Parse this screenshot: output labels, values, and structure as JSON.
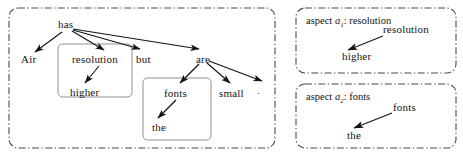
{
  "figure": {
    "type": "dependency-parse-diagram",
    "background_color": "#ffffff",
    "ink_color": "#141414",
    "panel_border_color": "#4a4a4a",
    "box_border_color": "#8a8a8a"
  },
  "left_panel": {
    "name": "full-sentence-dependency-tree",
    "nodes": [
      {
        "id": "has",
        "label": "has",
        "x": 58,
        "y": 21
      },
      {
        "id": "air",
        "label": "Air",
        "x": 21,
        "y": 55
      },
      {
        "id": "resolution",
        "label": "resolution",
        "x": 72,
        "y": 55
      },
      {
        "id": "but",
        "label": "but",
        "x": 136,
        "y": 55
      },
      {
        "id": "higher",
        "label": "higher",
        "x": 70,
        "y": 88
      },
      {
        "id": "are",
        "label": "are",
        "x": 196,
        "y": 55
      },
      {
        "id": "fonts",
        "label": "fonts",
        "x": 164,
        "y": 89
      },
      {
        "id": "small",
        "label": "small",
        "x": 219,
        "y": 89
      },
      {
        "id": "the",
        "label": "the",
        "x": 152,
        "y": 123
      },
      {
        "id": "period",
        "label": ".",
        "x": 258,
        "y": 86
      }
    ],
    "edges": [
      {
        "from": "has",
        "to": "air"
      },
      {
        "from": "has",
        "to": "resolution"
      },
      {
        "from": "has",
        "to": "but"
      },
      {
        "from": "has",
        "to": "are"
      },
      {
        "from": "resolution",
        "to": "higher"
      },
      {
        "from": "are",
        "to": "fonts"
      },
      {
        "from": "are",
        "to": "small"
      },
      {
        "from": "are",
        "to": "period"
      },
      {
        "from": "fonts",
        "to": "the"
      }
    ],
    "highlight_boxes": [
      {
        "id": "box-resolution-higher",
        "label": "resolution-subtree-box",
        "x": 58,
        "y": 44,
        "w": 74,
        "h": 53
      },
      {
        "id": "box-fonts-the",
        "label": "fonts-subtree-box",
        "x": 143,
        "y": 78,
        "w": 68,
        "h": 62
      }
    ]
  },
  "right_panels": [
    {
      "id": "aspect-1",
      "label_prefix": "aspect ",
      "label_symbol": "a",
      "label_subscript": "1",
      "label_suffix": ": resolution",
      "nodes": [
        {
          "id": "resolution",
          "label": "resolution",
          "x": 383,
          "y": 25
        },
        {
          "id": "higher",
          "label": "higher",
          "x": 342,
          "y": 52
        }
      ],
      "edges": [
        {
          "from": "resolution",
          "to": "higher"
        }
      ]
    },
    {
      "id": "aspect-2",
      "label_prefix": "aspect ",
      "label_symbol": "a",
      "label_subscript": "2",
      "label_suffix": ": fonts",
      "nodes": [
        {
          "id": "fonts",
          "label": "fonts",
          "x": 393,
          "y": 103
        },
        {
          "id": "the",
          "label": "the",
          "x": 347,
          "y": 131
        }
      ],
      "edges": [
        {
          "from": "fonts",
          "to": "the"
        }
      ]
    }
  ]
}
